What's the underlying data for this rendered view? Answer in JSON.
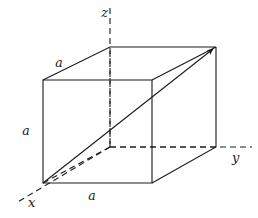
{
  "figure": {
    "background_color": "#ffffff",
    "line_color": "#1a1a1a",
    "solid_line_width": 1.1,
    "dashed_line_width": 1.1,
    "dash_pattern": "6,4"
  },
  "axes": {
    "z": {
      "label": "z",
      "label_x": 108,
      "label_y": 17,
      "line": {
        "x1": 110,
        "y1": 8,
        "x2": 110,
        "y2": 147
      },
      "style": "dashed"
    },
    "y": {
      "label": "y",
      "label_x": 232,
      "label_y": 162,
      "line": {
        "x1": 110,
        "y1": 147,
        "x2": 252,
        "y2": 147
      },
      "style": "dashed"
    },
    "x": {
      "label": "x",
      "label_x": 28,
      "label_y": 207,
      "line": {
        "x1": 110,
        "y1": 147,
        "x2": 16,
        "y2": 203
      },
      "style": "dashed"
    }
  },
  "cube": {
    "front_face": {
      "top_left": {
        "x": 43,
        "y": 80
      },
      "top_right": {
        "x": 152,
        "y": 80
      },
      "bottom_right": {
        "x": 152,
        "y": 183
      },
      "bottom_left": {
        "x": 43,
        "y": 183
      }
    },
    "rear_face": {
      "top_left": {
        "x": 110,
        "y": 47
      },
      "top_right": {
        "x": 216,
        "y": 47
      },
      "bottom_right": {
        "x": 216,
        "y": 147
      },
      "bottom_left": {
        "x": 110,
        "y": 147
      }
    },
    "origin": {
      "x": 110,
      "y": 147
    }
  },
  "edge_labels": [
    {
      "name": "top-edge-length",
      "text": "a",
      "x": 59,
      "y": 67
    },
    {
      "name": "left-edge-length",
      "text": "a",
      "x": 26,
      "y": 135
    },
    {
      "name": "bottom-edge-length",
      "text": "a",
      "x": 92,
      "y": 200
    }
  ],
  "diagonal": {
    "name": "body-diagonal-arrow",
    "from": {
      "x": 43,
      "y": 183
    },
    "to": {
      "x": 216,
      "y": 47
    },
    "style": "solid",
    "arrowhead": true
  },
  "hidden_diagonal": {
    "name": "base-diagonal",
    "from": {
      "x": 43,
      "y": 183
    },
    "to": {
      "x": 110,
      "y": 147
    },
    "style": "dashed"
  }
}
